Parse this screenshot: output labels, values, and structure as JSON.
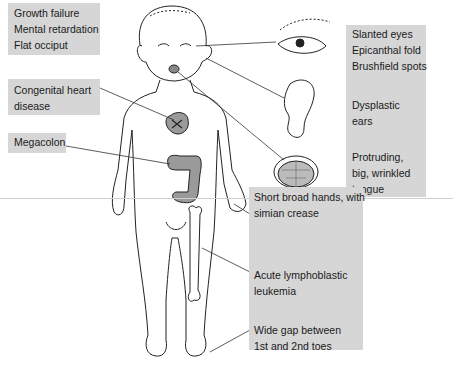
{
  "labels": {
    "head": [
      "Growth failure",
      "Mental retardation",
      "Flat occiput"
    ],
    "heart": [
      "Congenital heart",
      "disease"
    ],
    "colon": [
      "Megacolon"
    ],
    "eyes": [
      "Slanted eyes",
      "Epicanthal fold",
      "Brushfield spots"
    ],
    "ears": [
      "Dysplastic",
      "ears"
    ],
    "tongue": [
      "Protruding,",
      "big, wrinkled",
      "tongue"
    ],
    "hands": [
      "Short broad hands, with",
      "simian crease"
    ],
    "leukemia": [
      "Acute lymphoblastic",
      "leukemia"
    ],
    "toes": [
      "Wide gap between",
      "1st and 2nd toes"
    ]
  },
  "colors": {
    "label_box": "#d6d6d6",
    "organ_fill": "#9a9a9a",
    "line": "#333333"
  }
}
